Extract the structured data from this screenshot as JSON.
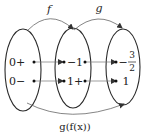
{
  "diagram": {
    "type": "function-composition-mapping",
    "colors": {
      "stroke": "#2a2a2a",
      "arrow": "#555555",
      "text": "#222222"
    },
    "arrows": {
      "top_left": "f",
      "top_right": "g",
      "bottom": "g(f(x))"
    },
    "sets": [
      {
        "name": "domain",
        "items": [
          {
            "label": "0+"
          },
          {
            "label": "0−"
          }
        ]
      },
      {
        "name": "intermediate",
        "items": [
          {
            "label": "−1"
          },
          {
            "label": "1+"
          }
        ]
      },
      {
        "name": "codomain",
        "items": [
          {
            "label": "−",
            "fraction": {
              "num": "3",
              "den": "2"
            }
          },
          {
            "label": "1"
          }
        ]
      }
    ]
  }
}
